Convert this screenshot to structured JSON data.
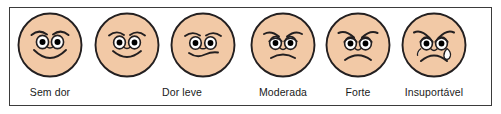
{
  "chart": {
    "kind": "pain-rating-scale",
    "language": "pt-BR",
    "frame_color": "#3b3b3b",
    "background_color": "#ffffff",
    "skin_color": "#F2C9A6",
    "outline_color": "#231F20",
    "eye_white_color": "#ffffff",
    "pupil_color": "#000000",
    "tear_color": "#ffffff",
    "face_count": 6,
    "label_count": 5
  },
  "faces": [
    {
      "id": "face-no-pain",
      "name": "Sem dor",
      "expression": "broad-smile",
      "level": 0,
      "cx": 50,
      "has_tears": false
    },
    {
      "id": "face-very-mild",
      "name": "Quase sem dor",
      "expression": "smile",
      "level": 1,
      "cx": 127,
      "has_tears": false
    },
    {
      "id": "face-mild",
      "name": "Dor leve",
      "expression": "slight-smile-flat",
      "level": 2,
      "cx": 203,
      "has_tears": false
    },
    {
      "id": "face-moderate",
      "name": "Moderada",
      "expression": "slight-frown",
      "level": 3,
      "cx": 283,
      "has_tears": false
    },
    {
      "id": "face-severe",
      "name": "Forte",
      "expression": "frown",
      "level": 4,
      "cx": 358,
      "has_tears": false
    },
    {
      "id": "face-unbearable",
      "name": "Insuportável",
      "expression": "crying-frown",
      "level": 5,
      "cx": 434,
      "has_tears": true
    }
  ],
  "labels": [
    {
      "text": "Sem dor",
      "cx": 50,
      "for_face": "face-no-pain"
    },
    {
      "text": "Dor leve",
      "cx": 182,
      "for_face": "face-mild"
    },
    {
      "text": "Moderada",
      "cx": 283,
      "for_face": "face-moderate"
    },
    {
      "text": "Forte",
      "cx": 358,
      "for_face": "face-severe"
    },
    {
      "text": "Insuportável",
      "cx": 434,
      "for_face": "face-unbearable"
    }
  ]
}
